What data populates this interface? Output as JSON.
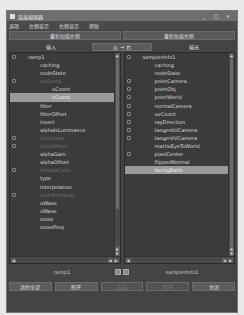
{
  "window": {
    "title": "连接编辑器",
    "controls": [
      "_",
      "□",
      "×"
    ]
  },
  "menubar": {
    "items": [
      "选项",
      "左侧显示",
      "右侧显示",
      "帮助"
    ]
  },
  "top_buttons": {
    "reload_left": "重新加载左侧",
    "reload_right": "重新加载右侧"
  },
  "tabs": {
    "input": "输入",
    "swap": "从 → 右",
    "output": "输出"
  },
  "left_panel": {
    "items": [
      {
        "label": "ramp1",
        "indent": 1,
        "icon": true,
        "dim": false,
        "selected": false
      },
      {
        "label": "caching",
        "indent": 2,
        "icon": false,
        "dim": false,
        "selected": false
      },
      {
        "label": "nodeState",
        "indent": 2,
        "icon": false,
        "dim": false,
        "selected": false
      },
      {
        "label": "uvCoord",
        "indent": 2,
        "icon": true,
        "dim": true,
        "selected": false
      },
      {
        "label": "uCoord",
        "indent": 3,
        "icon": false,
        "dim": false,
        "selected": false
      },
      {
        "label": "vCoord",
        "indent": 3,
        "icon": false,
        "dim": false,
        "selected": true
      },
      {
        "label": "filter",
        "indent": 2,
        "icon": false,
        "dim": false,
        "selected": false
      },
      {
        "label": "filterOffset",
        "indent": 2,
        "icon": false,
        "dim": false,
        "selected": false
      },
      {
        "label": "invert",
        "indent": 2,
        "icon": false,
        "dim": false,
        "selected": false
      },
      {
        "label": "alphaIsLuminance",
        "indent": 2,
        "icon": false,
        "dim": false,
        "selected": false
      },
      {
        "label": "colorGain",
        "indent": 2,
        "icon": true,
        "dim": true,
        "selected": false
      },
      {
        "label": "colorOffset",
        "indent": 2,
        "icon": true,
        "dim": true,
        "selected": false
      },
      {
        "label": "alphaGain",
        "indent": 2,
        "icon": false,
        "dim": false,
        "selected": false
      },
      {
        "label": "alphaOffset",
        "indent": 2,
        "icon": false,
        "dim": false,
        "selected": false
      },
      {
        "label": "defaultColor",
        "indent": 2,
        "icon": true,
        "dim": true,
        "selected": false
      },
      {
        "label": "type",
        "indent": 2,
        "icon": false,
        "dim": false,
        "selected": false
      },
      {
        "label": "interpolation",
        "indent": 2,
        "icon": false,
        "dim": false,
        "selected": false
      },
      {
        "label": "colorEntryList",
        "indent": 2,
        "icon": true,
        "dim": true,
        "selected": false
      },
      {
        "label": "uWave",
        "indent": 2,
        "icon": false,
        "dim": false,
        "selected": false
      },
      {
        "label": "vWave",
        "indent": 2,
        "icon": false,
        "dim": false,
        "selected": false
      },
      {
        "label": "noise",
        "indent": 2,
        "icon": false,
        "dim": false,
        "selected": false
      },
      {
        "label": "noiseFreq",
        "indent": 2,
        "icon": false,
        "dim": false,
        "selected": false
      }
    ]
  },
  "right_panel": {
    "items": [
      {
        "label": "samplerInfo1",
        "indent": 1,
        "icon": true,
        "dim": false,
        "selected": false
      },
      {
        "label": "caching",
        "indent": 2,
        "icon": false,
        "dim": false,
        "selected": false
      },
      {
        "label": "nodeState",
        "indent": 2,
        "icon": false,
        "dim": false,
        "selected": false
      },
      {
        "label": "pointCamera",
        "indent": 2,
        "icon": true,
        "dim": false,
        "selected": false
      },
      {
        "label": "pointObj",
        "indent": 2,
        "icon": true,
        "dim": false,
        "selected": false
      },
      {
        "label": "pointWorld",
        "indent": 2,
        "icon": true,
        "dim": false,
        "selected": false
      },
      {
        "label": "normalCamera",
        "indent": 2,
        "icon": true,
        "dim": false,
        "selected": false
      },
      {
        "label": "uvCoord",
        "indent": 2,
        "icon": true,
        "dim": false,
        "selected": false
      },
      {
        "label": "rayDirection",
        "indent": 2,
        "icon": true,
        "dim": false,
        "selected": false
      },
      {
        "label": "tangentUCamera",
        "indent": 2,
        "icon": true,
        "dim": false,
        "selected": false
      },
      {
        "label": "tangentVCamera",
        "indent": 2,
        "icon": true,
        "dim": false,
        "selected": false
      },
      {
        "label": "matrixEyeToWorld",
        "indent": 2,
        "icon": false,
        "dim": false,
        "selected": false
      },
      {
        "label": "pixelCenter",
        "indent": 2,
        "icon": true,
        "dim": false,
        "selected": false
      },
      {
        "label": "flippedNormal",
        "indent": 2,
        "icon": false,
        "dim": false,
        "selected": false
      },
      {
        "label": "facingRatio",
        "indent": 2,
        "icon": false,
        "dim": false,
        "selected": true
      }
    ]
  },
  "nodes": {
    "left": "ramp1",
    "right": "samplerInfo1"
  },
  "bottom_buttons": [
    {
      "label": "清除全部",
      "disabled": false
    },
    {
      "label": "断开",
      "disabled": false
    },
    {
      "label": "连接",
      "disabled": true
    },
    {
      "label": "断开",
      "disabled": true
    },
    {
      "label": "关闭",
      "disabled": false
    }
  ]
}
